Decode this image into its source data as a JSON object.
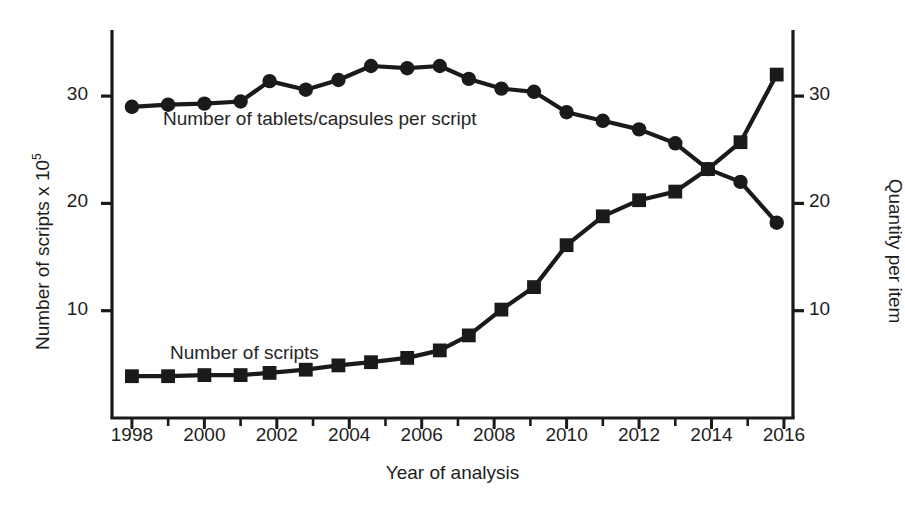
{
  "chart_data": {
    "type": "line",
    "title": "",
    "xlabel": "Year of analysis",
    "ylabel": "Number of scripts x 10⁵",
    "ylabel_right": "Quantity per item",
    "xlim": [
      1997.4,
      2016.3
    ],
    "ylim": [
      0,
      35.5
    ],
    "grid": false,
    "legend": "inline-annotations",
    "xticks_major": [
      1998,
      2000,
      2002,
      2004,
      2006,
      2008,
      2010,
      2012,
      2014,
      2016
    ],
    "xticks_minor": [
      1999,
      2001,
      2003,
      2005,
      2007,
      2009,
      2011,
      2013,
      2015
    ],
    "yticks_left": [
      10,
      20,
      30
    ],
    "yticks_right": [
      10,
      20,
      30
    ],
    "x": [
      1998,
      1999,
      2000,
      2001,
      2001.8,
      2002.8,
      2003.7,
      2004.6,
      2005.6,
      2006.5,
      2007.3,
      2008.2,
      2009.1,
      2010,
      2011,
      2012,
      2013,
      2013.9,
      2014.8,
      2015.8
    ],
    "series": [
      {
        "name": "Number of tablets/capsules per script",
        "marker": "circle",
        "axis": "right",
        "color": "#1a1a1a",
        "values": [
          29.0,
          29.2,
          29.3,
          29.5,
          31.4,
          30.6,
          31.5,
          32.8,
          32.6,
          32.8,
          31.6,
          30.7,
          30.4,
          28.5,
          27.7,
          26.9,
          25.6,
          23.2,
          22.0,
          18.2
        ]
      },
      {
        "name": "Number of scripts",
        "marker": "square",
        "axis": "left",
        "color": "#1a1a1a",
        "values": [
          3.9,
          3.9,
          4.0,
          4.0,
          4.2,
          4.5,
          4.9,
          5.2,
          5.6,
          6.3,
          7.7,
          10.1,
          12.2,
          16.1,
          18.8,
          20.3,
          21.1,
          23.2,
          25.7,
          32.0
        ]
      }
    ]
  },
  "annotations": {
    "tablets_label": "Number of tablets/capsules per script",
    "scripts_label": "Number of scripts"
  },
  "axes": {
    "left_title_main": "Number of scripts x 10",
    "left_title_sup": "5",
    "right_title": "Quantity per item",
    "x_title": "Year of analysis"
  },
  "colors": {
    "line": "#1a1a1a",
    "axis": "#1a1a1a",
    "background": "#ffffff",
    "text": "#1d1d1d"
  }
}
